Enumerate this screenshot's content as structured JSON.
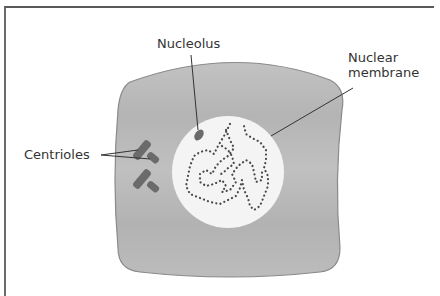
{
  "diagram": {
    "labels": {
      "nucleolus": "Nucleolus",
      "nuclear_membrane_line1": "Nuclear",
      "nuclear_membrane_line2": "membrane",
      "centrioles": "Centrioles"
    },
    "colors": {
      "cytoplasm": "#b9b9b9",
      "cell_outline": "#8a8a8a",
      "nucleus": "#f4f4f4",
      "chromatin": "#4a4a4a",
      "organelle": "#6b6b6b",
      "leader_line": "#333333",
      "frame": "#5a5a5a"
    }
  }
}
